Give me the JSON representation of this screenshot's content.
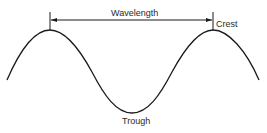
{
  "diagram": {
    "labels": {
      "wavelength": "Wavelength",
      "crest": "Crest",
      "trough": "Trough"
    },
    "colors": {
      "stroke": "#1a1a1a",
      "text": "#2a2a2a",
      "background": "#ffffff"
    },
    "elements": [
      {
        "type": "sine-wave",
        "description": "One full period plus partial, crests at left and right, trough in middle"
      },
      {
        "type": "dimension-arrow",
        "description": "Double-headed arrow spanning crest to crest labeled Wavelength"
      }
    ]
  }
}
